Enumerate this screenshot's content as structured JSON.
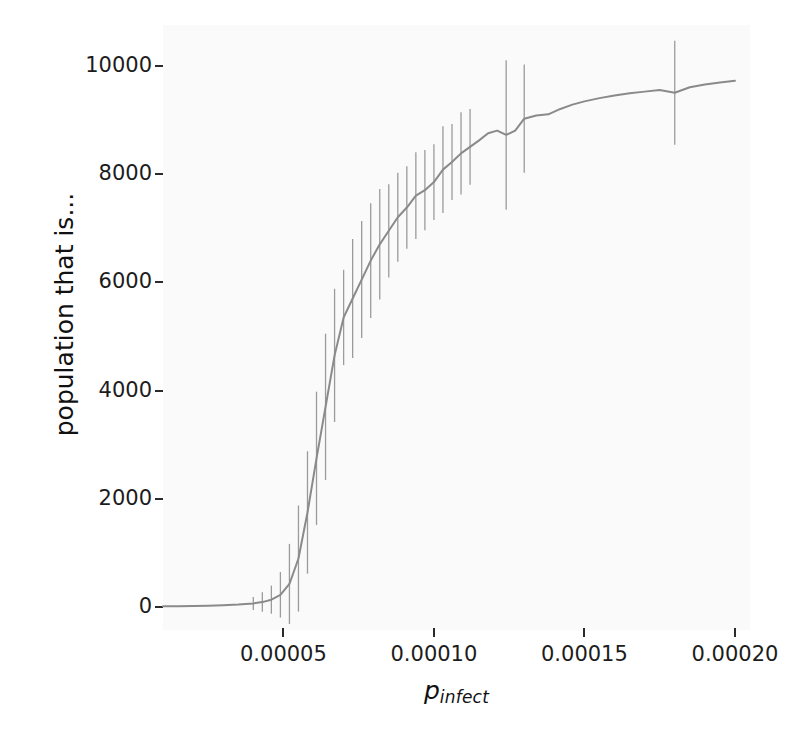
{
  "figure": {
    "background_color": "#ffffff",
    "panel_color": "#fafafa",
    "line_color": "#8a8a8a",
    "errorbar_color": "#9b9b9b",
    "tick_color": "#2a2a2a",
    "text_color": "#1c1c1c",
    "clipped_header_text": "",
    "xlabel_base": "p",
    "xlabel_sub": "infect"
  },
  "chart_data": {
    "type": "line",
    "title": "",
    "subtitle": "",
    "xlabel": "p_infect",
    "ylabel": "population that is...",
    "xlim": [
      1e-05,
      0.000205
    ],
    "ylim": [
      -420,
      10750
    ],
    "xticks": [
      5e-05,
      0.0001,
      0.00015,
      0.0002
    ],
    "xtick_labels": [
      "0.00005",
      "0.00010",
      "0.00015",
      "0.00020"
    ],
    "yticks": [
      0,
      2000,
      4000,
      6000,
      8000,
      10000
    ],
    "ytick_labels": [
      "0",
      "2000",
      "4000",
      "6000",
      "8000",
      "10000"
    ],
    "grid": false,
    "legend": null,
    "error_bars": "vertical",
    "series": [
      {
        "name": "mean population infected",
        "x": [
          1e-05,
          1.5e-05,
          2e-05,
          2.5e-05,
          3e-05,
          3.5e-05,
          4e-05,
          4.3e-05,
          4.6e-05,
          4.9e-05,
          5.2e-05,
          5.5e-05,
          5.8e-05,
          6.1e-05,
          6.4e-05,
          6.7e-05,
          7e-05,
          7.3e-05,
          7.6e-05,
          7.9e-05,
          8.2e-05,
          8.5e-05,
          8.8e-05,
          9.1e-05,
          9.4e-05,
          9.7e-05,
          0.0001,
          0.000103,
          0.000106,
          0.000109,
          0.000112,
          0.000115,
          0.000118,
          0.000121,
          0.000124,
          0.000127,
          0.00013,
          0.000134,
          0.000138,
          0.000142,
          0.000146,
          0.00015,
          0.000155,
          0.00016,
          0.000165,
          0.00017,
          0.000175,
          0.00018,
          0.000185,
          0.00019,
          0.000195,
          0.0002
        ],
        "y": [
          18,
          20,
          24,
          30,
          38,
          50,
          70,
          95,
          140,
          230,
          430,
          900,
          1750,
          2750,
          3700,
          4650,
          5350,
          5700,
          6050,
          6400,
          6700,
          6950,
          7200,
          7380,
          7600,
          7700,
          7850,
          8080,
          8220,
          8380,
          8500,
          8620,
          8750,
          8800,
          8720,
          8800,
          9020,
          9080,
          9100,
          9200,
          9280,
          9340,
          9400,
          9450,
          9490,
          9520,
          9550,
          9500,
          9600,
          9650,
          9690,
          9720
        ],
        "errors": [
          0,
          0,
          0,
          0,
          0,
          0,
          120,
          180,
          260,
          420,
          740,
          980,
          1130,
          1230,
          1350,
          1230,
          880,
          1100,
          1080,
          1060,
          1020,
          860,
          820,
          760,
          800,
          740,
          700,
          800,
          700,
          760,
          700,
          0,
          0,
          0,
          1380,
          0,
          1000,
          0,
          0,
          0,
          0,
          0,
          0,
          0,
          0,
          0,
          0,
          960,
          0,
          0,
          0,
          0
        ]
      }
    ]
  }
}
